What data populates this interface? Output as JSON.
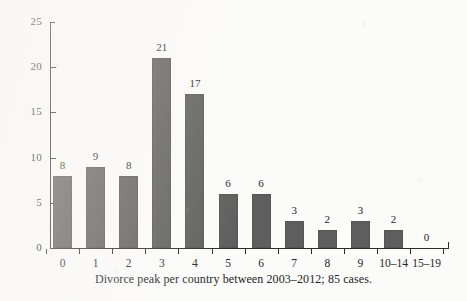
{
  "chart_data": {
    "type": "bar",
    "title": "",
    "subtitle": "",
    "caption": "Divorce peak per country between 2003–2012; 85 cases.",
    "xlabel": "",
    "ylabel": "",
    "categories": [
      "0",
      "1",
      "2",
      "3",
      "4",
      "5",
      "6",
      "7",
      "8",
      "9",
      "10–14",
      "15–19"
    ],
    "values": [
      8,
      9,
      8,
      21,
      17,
      6,
      6,
      3,
      2,
      3,
      2,
      0
    ],
    "value_labels": [
      "8",
      "9",
      "8",
      "21",
      "17",
      "6",
      "6",
      "3",
      "2",
      "3",
      "2",
      "0"
    ],
    "ylim": [
      0,
      25
    ],
    "ytick_values": [
      0,
      5,
      10,
      15,
      20,
      25
    ],
    "ytick_labels": [
      "0",
      "5",
      "10",
      "15",
      "20",
      "25"
    ],
    "grid": false,
    "legend": null,
    "legend_position": "none",
    "bar_color": "#5e5e5e",
    "axis_color": "#2b2b2b",
    "text_color": "#262626",
    "background_color": "#fbfbfa",
    "total_cases": 85,
    "period": "2003–2012"
  }
}
